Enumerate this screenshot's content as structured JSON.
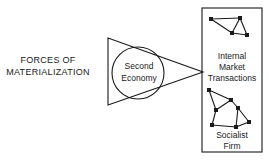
{
  "figure": {
    "title_text_left": {
      "line1": "FORCES OF",
      "line2": "MATERIALIZATION"
    },
    "triangle_label": {
      "line1": "Second",
      "line2": "Economy"
    },
    "box_labels": {
      "upper": {
        "line1": "Internal",
        "line2": "Market",
        "line3": "Transactions"
      },
      "lower": {
        "line1": "Socialist",
        "line2": "Firm"
      }
    },
    "colors": {
      "stroke": "#1a1a1a",
      "background": "#ffffff",
      "text": "#1a1a1a"
    },
    "shapes": {
      "triangle": {
        "name": "right-pointing-triangle",
        "x1": 108,
        "y1": 38,
        "x2": 108,
        "y2": 105,
        "apex_x": 203,
        "apex_y": 72
      },
      "circle": {
        "name": "second-economy-circle",
        "cx": 138,
        "cy": 73,
        "r": 26
      },
      "box": {
        "name": "socialist-firm-box",
        "x": 202,
        "y": 8,
        "width": 60,
        "height": 144
      }
    },
    "networks": {
      "upper": {
        "nodes": [
          [
            211,
            19
          ],
          [
            240,
            18
          ],
          [
            232,
            33
          ],
          [
            247,
            35
          ]
        ],
        "edges": [
          [
            0,
            1
          ],
          [
            0,
            2
          ],
          [
            1,
            2
          ],
          [
            1,
            3
          ],
          [
            2,
            3
          ]
        ]
      },
      "lower": {
        "nodes": [
          [
            209,
            90
          ],
          [
            231,
            100
          ],
          [
            216,
            110
          ],
          [
            238,
            108
          ],
          [
            212,
            125
          ],
          [
            236,
            127
          ],
          [
            249,
            122
          ]
        ],
        "edges": [
          [
            0,
            1
          ],
          [
            0,
            2
          ],
          [
            1,
            2
          ],
          [
            1,
            3
          ],
          [
            2,
            4
          ],
          [
            3,
            5
          ],
          [
            3,
            6
          ],
          [
            4,
            5
          ],
          [
            5,
            6
          ]
        ]
      }
    }
  }
}
